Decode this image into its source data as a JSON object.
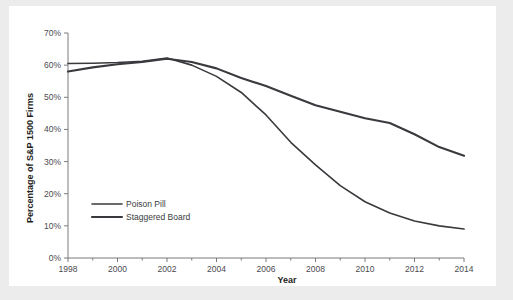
{
  "chart_data": {
    "type": "line",
    "title": "",
    "xlabel": "Year",
    "ylabel": "Percentage of S&P 1500 Firms",
    "xlim": [
      1998,
      2014
    ],
    "ylim": [
      0,
      70
    ],
    "grid": false,
    "legend_position": "inside-left-lower",
    "x": [
      1998,
      1999,
      2000,
      2001,
      2002,
      2003,
      2004,
      2005,
      2006,
      2007,
      2008,
      2009,
      2010,
      2011,
      2012,
      2013,
      2014
    ],
    "xticklabels": [
      "1998",
      "2000",
      "2002",
      "2004",
      "2006",
      "2008",
      "2010",
      "2012",
      "2014"
    ],
    "xticks": [
      1998,
      2000,
      2002,
      2004,
      2006,
      2008,
      2010,
      2012,
      2014
    ],
    "xminorticks": [
      1999,
      2001,
      2003,
      2005,
      2007,
      2009,
      2011,
      2013
    ],
    "yticklabels": [
      "0%",
      "10%",
      "20%",
      "30%",
      "40%",
      "50%",
      "60%",
      "70%"
    ],
    "yticks": [
      0,
      10,
      20,
      30,
      40,
      50,
      60,
      70
    ],
    "series": [
      {
        "name": "Poison Pill",
        "color": "#3a3a3e",
        "width": 1.6,
        "values": [
          60.5,
          60.6,
          60.8,
          61.2,
          62.2,
          60.0,
          56.5,
          51.5,
          44.5,
          36.0,
          29.0,
          22.5,
          17.5,
          14.0,
          11.5,
          10.0,
          9.0
        ]
      },
      {
        "name": "Staggered Board",
        "color": "#3a3a3e",
        "width": 2.1,
        "values": [
          58.0,
          59.3,
          60.3,
          61.0,
          62.0,
          61.0,
          59.0,
          56.0,
          53.5,
          50.5,
          47.5,
          45.5,
          43.5,
          42.0,
          38.5,
          34.5,
          31.8
        ]
      }
    ]
  },
  "axes": {
    "y_title": "Percentage of S&P 1500 Firms",
    "x_title": "Year"
  },
  "legend": {
    "items": [
      {
        "label": "Poison Pill"
      },
      {
        "label": "Staggered Board"
      }
    ]
  },
  "yticklabels": {
    "t0": "0%",
    "t1": "10%",
    "t2": "20%",
    "t3": "30%",
    "t4": "40%",
    "t5": "50%",
    "t6": "60%",
    "t7": "70%"
  },
  "xticklabels": {
    "t0": "1998",
    "t1": "2000",
    "t2": "2002",
    "t3": "2004",
    "t4": "2006",
    "t5": "2008",
    "t6": "2010",
    "t7": "2012",
    "t8": "2014"
  },
  "colors": {
    "page_background": "#ececed",
    "panel_background": "#ffffff",
    "axis": "#7b7b7f",
    "line": "#3a3a3e",
    "text": "#3a3a3e",
    "title_text": "#1d1d20"
  }
}
